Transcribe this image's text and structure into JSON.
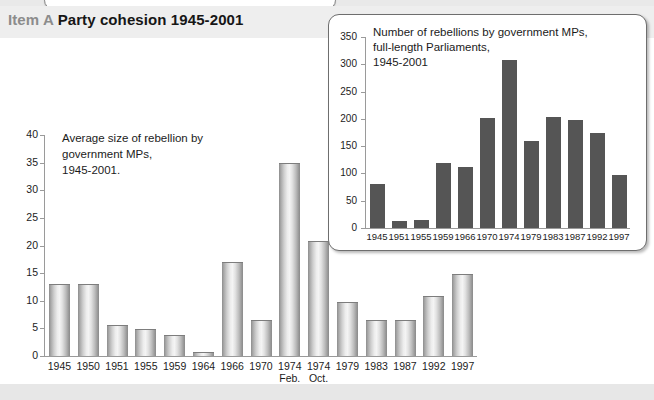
{
  "header": {
    "item_label": "Item A",
    "title": "Party cohesion 1945-2001"
  },
  "chart_data": [
    {
      "id": "main",
      "type": "bar",
      "title": "Average size of rebellion by\ngovernment MPs,\n1945-2001.",
      "xlabel": "",
      "ylabel": "",
      "ylim": [
        0,
        40
      ],
      "yticks": [
        0,
        5,
        10,
        15,
        20,
        25,
        30,
        35,
        40
      ],
      "grid": false,
      "legend": "none",
      "categories": [
        "1945",
        "1950",
        "1951",
        "1955",
        "1959",
        "1964",
        "1966",
        "1970",
        "1974",
        "1974",
        "1979",
        "1983",
        "1987",
        "1992",
        "1997"
      ],
      "category_sublabels": [
        "",
        "",
        "",
        "",
        "",
        "",
        "",
        "",
        "Feb.",
        "Oct.",
        "",
        "",
        "",
        "",
        ""
      ],
      "values": [
        13.0,
        13.0,
        5.7,
        4.9,
        3.8,
        0.8,
        17.0,
        6.6,
        35.0,
        20.8,
        9.7,
        6.6,
        6.6,
        10.9,
        14.8
      ]
    },
    {
      "id": "inset",
      "type": "bar",
      "title": "Number of rebellions by government MPs,\nfull-length Parliaments,\n1945-2001",
      "xlabel": "",
      "ylabel": "",
      "ylim": [
        0,
        350
      ],
      "yticks": [
        0,
        50,
        100,
        150,
        200,
        250,
        300,
        350
      ],
      "grid": false,
      "legend": "none",
      "categories": [
        "1945",
        "1951",
        "1955",
        "1959",
        "1966",
        "1970",
        "1974",
        "1979",
        "1983",
        "1987",
        "1992",
        "1997"
      ],
      "values": [
        80,
        13,
        15,
        120,
        112,
        202,
        307,
        159,
        203,
        198,
        174,
        98
      ]
    }
  ],
  "colors": {
    "page_background": "#e9e9e9",
    "panel_background": "#ffffff",
    "header_band": "#eeeeee",
    "item_label": "#8c8c8c",
    "title_text": "#161616",
    "inset_bar": "#555555",
    "axis": "#9a9a9a",
    "inset_border": "#6e6e6e"
  }
}
